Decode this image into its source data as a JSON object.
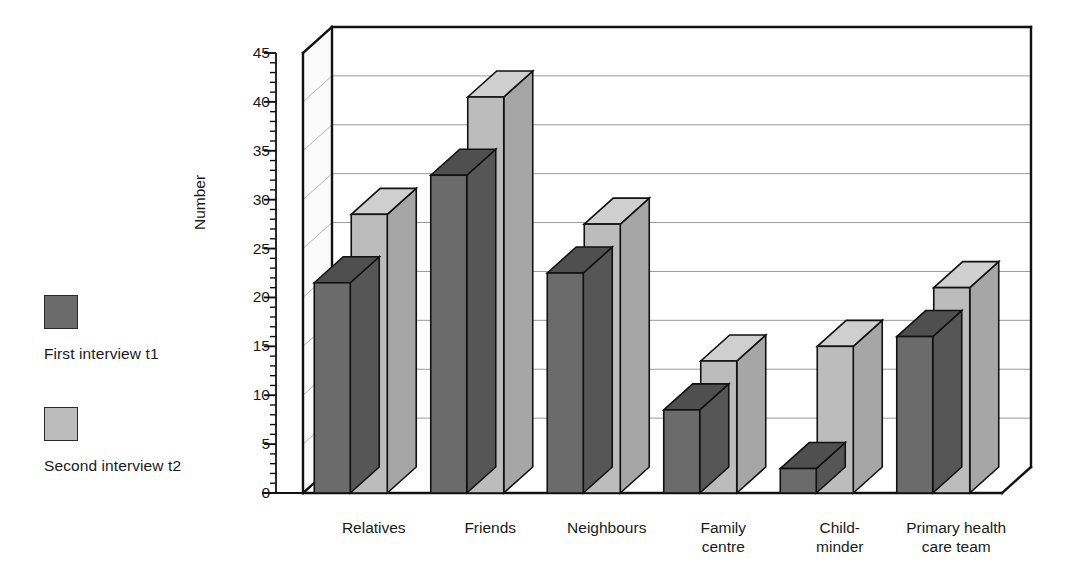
{
  "chart_data": {
    "type": "bar",
    "title": "",
    "subtitle": "",
    "xlabel": "",
    "ylabel": "Number",
    "ylim": [
      0,
      45
    ],
    "yticks": [
      0,
      5,
      10,
      15,
      20,
      25,
      30,
      35,
      40,
      45
    ],
    "ytick_labels": [
      "0",
      "5",
      "10",
      "15",
      "20",
      "25",
      "30",
      "35",
      "40",
      "45"
    ],
    "minor_tick_interval": 1,
    "grid": "horizontal",
    "style": "3d-bar",
    "legend_position": "left-outside",
    "categories": [
      "Relatives",
      "Friends",
      "Neighbours",
      "Family\ncentre",
      "Child-\nminder",
      "Primary health\ncare team"
    ],
    "series": [
      {
        "name": "First interview t1",
        "color": "#6b6b6b",
        "top_color": "#4f4f4f",
        "side_color": "#565656",
        "values": [
          21.5,
          32.5,
          22.5,
          8.5,
          2.5,
          16
        ]
      },
      {
        "name": "Second interview t2",
        "color": "#bcbcbc",
        "top_color": "#cfcfcf",
        "side_color": "#a6a6a6",
        "values": [
          28.5,
          40.5,
          27.5,
          13.5,
          15,
          21
        ]
      }
    ]
  },
  "legend": {
    "entries": [
      {
        "label": "First interview t1",
        "swatch": "#6b6b6b"
      },
      {
        "label": "Second interview t2",
        "swatch": "#bcbcbc"
      }
    ]
  },
  "axes": {
    "y_title": "Number"
  }
}
